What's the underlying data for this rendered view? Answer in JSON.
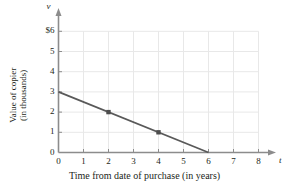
{
  "chart_data": {
    "type": "line",
    "title": "",
    "subtitle": "",
    "xlabel": "Time from date of purchase (in years)",
    "ylabel_line1": "Value of copier",
    "ylabel_line2": "(in thousands)",
    "x_axis_variable": "t",
    "y_axis_variable": "v",
    "xlim": [
      0,
      8
    ],
    "ylim": [
      0,
      6
    ],
    "x_ticks": [
      0,
      1,
      2,
      3,
      4,
      5,
      6,
      7,
      8
    ],
    "x_tick_labels": [
      "0",
      "1",
      "2",
      "3",
      "4",
      "5",
      "6",
      "7",
      "8"
    ],
    "y_ticks": [
      0,
      1,
      2,
      3,
      4,
      5,
      6
    ],
    "y_tick_labels": [
      "0",
      "1",
      "2",
      "3",
      "4",
      "5",
      "$6"
    ],
    "grid": true,
    "grid_color": "#e8e8e8",
    "legend": "none",
    "axis_color": "#8c8c8c",
    "line_color": "#595959",
    "marker_color": "#4d4d4d",
    "series": [
      {
        "name": "Value of copier",
        "x": [
          0,
          6
        ],
        "y": [
          3,
          0
        ],
        "endpoints": [
          {
            "x": 0,
            "y": 3
          },
          {
            "x": 6,
            "y": 0
          }
        ],
        "marked_points": [
          {
            "x": 2,
            "y": 2
          },
          {
            "x": 4,
            "y": 1
          }
        ]
      }
    ]
  }
}
